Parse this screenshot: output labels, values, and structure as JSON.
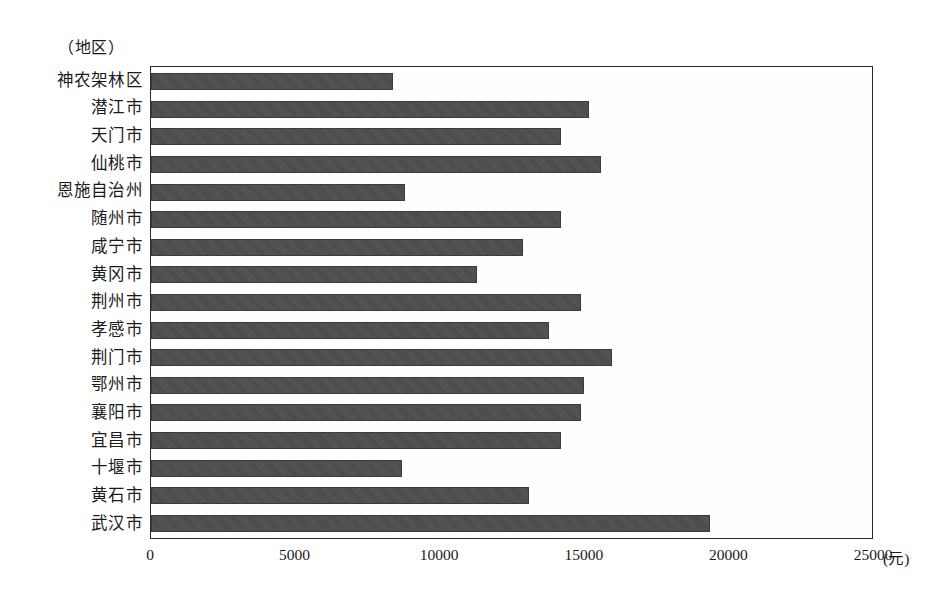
{
  "chart_data": {
    "type": "bar",
    "orientation": "horizontal",
    "title": "",
    "xlabel": "(元)",
    "ylabel": "（地区）",
    "xlim": [
      0,
      25000
    ],
    "xticks": [
      0,
      5000,
      10000,
      15000,
      20000,
      25000
    ],
    "xtick_labels": [
      "0",
      "5000",
      "10000",
      "15000",
      "20000",
      "25000"
    ],
    "grid": false,
    "legend": false,
    "bar_color": "#4d4d4d",
    "categories": [
      "神农架林区",
      "潜江市",
      "天门市",
      "仙桃市",
      "恩施自治州",
      "随州市",
      "咸宁市",
      "黄冈市",
      "荆州市",
      "孝感市",
      "荆门市",
      "鄂州市",
      "襄阳市",
      "宜昌市",
      "十堰市",
      "黄石市",
      "武汉市"
    ],
    "values": [
      8400,
      15200,
      14200,
      15600,
      8800,
      14200,
      12900,
      11300,
      14900,
      13800,
      16000,
      15000,
      14900,
      14200,
      8700,
      13100,
      19400
    ]
  }
}
